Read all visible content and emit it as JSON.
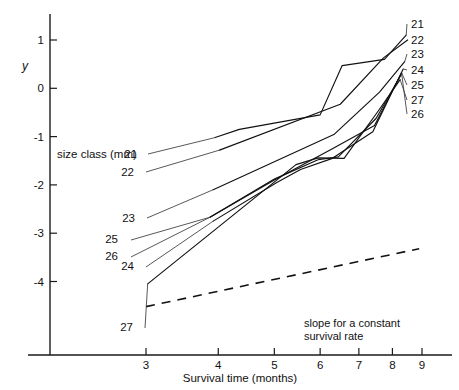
{
  "chart_data": {
    "type": "line",
    "title": "",
    "xlabel": "Survival time (months)",
    "ylabel": "y",
    "xscale": "log",
    "xlim": [
      2.55,
      9.9
    ],
    "ylim": [
      -4.62,
      1.42
    ],
    "xticks": [
      3,
      4,
      5,
      6,
      7,
      8,
      9
    ],
    "xticklabels": [
      "3",
      "4",
      "5",
      "6",
      "7",
      "8",
      "9"
    ],
    "yticks": [
      1,
      0,
      -1,
      -2,
      -3,
      -4
    ],
    "yticklabels": [
      "1",
      "0",
      "-1",
      "-2",
      "-3",
      "-4"
    ],
    "grid": false,
    "legend_position": "inline-end-labels",
    "legend_title": "size class (mm)",
    "series": [
      {
        "name": "21",
        "label_left": "21",
        "label_right": "21",
        "x": [
          3.95,
          4.35,
          6.0,
          6.55,
          7.75,
          8.45
        ],
        "y": [
          -1.02,
          -0.85,
          -0.55,
          0.47,
          0.6,
          1.1
        ]
      },
      {
        "name": "22",
        "label_left": "22",
        "label_right": "22",
        "x": [
          4.02,
          6.5,
          7.72,
          8.5
        ],
        "y": [
          -1.28,
          -0.33,
          0.63,
          1.0
        ]
      },
      {
        "name": "23",
        "label_left": "23",
        "label_right": "23",
        "x": [
          3.92,
          6.35,
          7.6,
          8.4
        ],
        "y": [
          -2.1,
          -0.95,
          -0.08,
          0.55
        ]
      },
      {
        "name": "24",
        "label_left": "24",
        "label_right": "24",
        "x": [
          3.92,
          5.05,
          5.55,
          6.3,
          7.4,
          8.35
        ],
        "y": [
          -2.75,
          -1.95,
          -1.68,
          -1.45,
          -0.9,
          0.4
        ]
      },
      {
        "name": "25",
        "label_left": "25",
        "label_right": "25",
        "x": [
          3.87,
          5.0,
          6.3,
          7.45,
          8.3
        ],
        "y": [
          -2.67,
          -1.9,
          -1.25,
          -0.77,
          0.32
        ]
      },
      {
        "name": "26",
        "label_left": "26",
        "label_right": "26",
        "x": [
          3.87,
          5.0,
          5.95,
          6.45,
          7.5,
          8.3
        ],
        "y": [
          -2.67,
          -1.88,
          -1.48,
          -1.42,
          -0.62,
          0.3
        ]
      },
      {
        "name": "27",
        "label_left": "27",
        "label_right": "27",
        "x": [
          3.02,
          5.45,
          5.95,
          6.6,
          7.55,
          8.25
        ],
        "y": [
          -4.05,
          -1.58,
          -1.44,
          -1.45,
          -0.48,
          0.18
        ]
      }
    ],
    "reference_line": {
      "label_line1": "slope for a constant",
      "label_line2": "survival rate",
      "style": "dashed",
      "x": [
        3.0,
        8.9
      ],
      "y": [
        -4.52,
        -3.32
      ]
    },
    "right_label_order": [
      "21",
      "22",
      "23",
      "24",
      "25",
      "27",
      "26"
    ]
  },
  "axes": {
    "y_axis_title": "y",
    "x_axis_title": "Survival time (months)"
  },
  "annotations": {
    "size_class_caption": "size class (mm)"
  }
}
